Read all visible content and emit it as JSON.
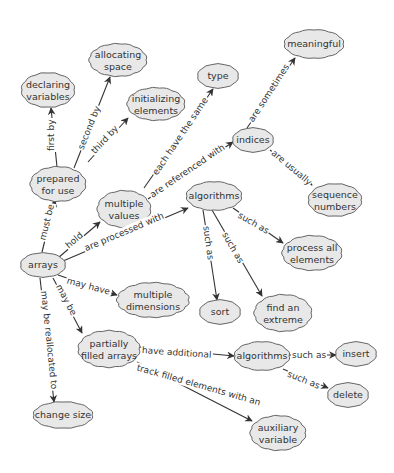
{
  "diagram": {
    "type": "concept-map",
    "style": {
      "cloud_fill": "#e8e8e8",
      "cloud_stroke": "#555555",
      "line_color": "#333333",
      "text_color": "#333333",
      "background": "#ffffff"
    },
    "nodes": [
      {
        "id": "arrays",
        "label": "arrays",
        "x": 43,
        "y": 265,
        "w": 44,
        "h": 24
      },
      {
        "id": "declaring",
        "label": "declaring\nvariables",
        "x": 48,
        "y": 90,
        "w": 52,
        "h": 34
      },
      {
        "id": "allocating",
        "label": "allocating\nspace",
        "x": 118,
        "y": 60,
        "w": 56,
        "h": 32
      },
      {
        "id": "initializing",
        "label": "initializing\nelements",
        "x": 156,
        "y": 104,
        "w": 56,
        "h": 32
      },
      {
        "id": "type",
        "label": "type",
        "x": 218,
        "y": 76,
        "w": 40,
        "h": 24
      },
      {
        "id": "meaningful",
        "label": "meaningful",
        "x": 314,
        "y": 44,
        "w": 58,
        "h": 28
      },
      {
        "id": "prepared",
        "label": "prepared\nfor use",
        "x": 58,
        "y": 184,
        "w": 54,
        "h": 34
      },
      {
        "id": "multiple_values",
        "label": "multiple\nvalues",
        "x": 124,
        "y": 209,
        "w": 52,
        "h": 36
      },
      {
        "id": "indices",
        "label": "indices",
        "x": 253,
        "y": 140,
        "w": 40,
        "h": 24
      },
      {
        "id": "sequence",
        "label": "sequence\nnumbers",
        "x": 335,
        "y": 200,
        "w": 52,
        "h": 32
      },
      {
        "id": "algorithms1",
        "label": "algorithms",
        "x": 214,
        "y": 196,
        "w": 54,
        "h": 28
      },
      {
        "id": "process_all",
        "label": "process all\nelements",
        "x": 312,
        "y": 253,
        "w": 58,
        "h": 34
      },
      {
        "id": "multiple_dims",
        "label": "multiple\ndimensions",
        "x": 153,
        "y": 300,
        "w": 70,
        "h": 34
      },
      {
        "id": "sort",
        "label": "sort",
        "x": 220,
        "y": 312,
        "w": 40,
        "h": 24
      },
      {
        "id": "extreme",
        "label": "find an\nextreme",
        "x": 283,
        "y": 313,
        "w": 56,
        "h": 36
      },
      {
        "id": "partially",
        "label": "partially\nfilled arrays",
        "x": 109,
        "y": 349,
        "w": 60,
        "h": 36
      },
      {
        "id": "algorithms2",
        "label": "algorithms",
        "x": 262,
        "y": 356,
        "w": 54,
        "h": 28
      },
      {
        "id": "insert",
        "label": "insert",
        "x": 356,
        "y": 354,
        "w": 40,
        "h": 24
      },
      {
        "id": "delete",
        "label": "delete",
        "x": 348,
        "y": 395,
        "w": 40,
        "h": 24
      },
      {
        "id": "change_size",
        "label": "change size",
        "x": 63,
        "y": 415,
        "w": 58,
        "h": 26
      },
      {
        "id": "auxiliary",
        "label": "auxiliary\nvariable",
        "x": 278,
        "y": 433,
        "w": 54,
        "h": 34
      }
    ],
    "links": [
      {
        "from": "prepared",
        "to": "declaring",
        "label": "first by",
        "x1": 57,
        "y1": 167,
        "x2": 51,
        "y2": 108,
        "lx": 51,
        "ly": 152,
        "angle": -90
      },
      {
        "from": "prepared",
        "to": "allocating",
        "label": "second by",
        "x1": 74,
        "y1": 168,
        "x2": 110,
        "y2": 77,
        "lx": 80,
        "ly": 150,
        "angle": -68
      },
      {
        "from": "prepared",
        "to": "initializing",
        "label": "third by",
        "x1": 88,
        "y1": 162,
        "x2": 128,
        "y2": 118,
        "lx": 92,
        "ly": 153,
        "angle": -47
      },
      {
        "from": "multiple_values",
        "to": "type",
        "label": "each have the same",
        "x1": 144,
        "y1": 188,
        "x2": 213,
        "y2": 89,
        "lx": 154,
        "ly": 175,
        "angle": -56
      },
      {
        "from": "multiple_values",
        "to": "indices",
        "label": "are referenced with",
        "x1": 148,
        "y1": 199,
        "x2": 233,
        "y2": 142,
        "lx": 150,
        "ly": 196,
        "angle": -34
      },
      {
        "from": "indices",
        "to": "meaningful",
        "label": "are sometimes",
        "x1": 247,
        "y1": 128,
        "x2": 295,
        "y2": 58,
        "lx": 250,
        "ly": 122,
        "angle": -57
      },
      {
        "from": "indices",
        "to": "sequence",
        "label": "are usually",
        "x1": 270,
        "y1": 150,
        "x2": 312,
        "y2": 185,
        "lx": 272,
        "ly": 151,
        "angle": 40
      },
      {
        "from": "arrays",
        "to": "prepared",
        "label": "must be",
        "x1": 42,
        "y1": 252,
        "x2": 55,
        "y2": 200,
        "lx": 42,
        "ly": 241,
        "angle": -76
      },
      {
        "from": "arrays",
        "to": "multiple_values",
        "label": "hold",
        "x1": 58,
        "y1": 258,
        "x2": 100,
        "y2": 222,
        "lx": 66,
        "ly": 247,
        "angle": -40
      },
      {
        "from": "arrays",
        "to": "algorithms1",
        "label": "are processed with",
        "x1": 63,
        "y1": 261,
        "x2": 188,
        "y2": 208,
        "lx": 84,
        "ly": 249,
        "angle": -23
      },
      {
        "from": "arrays",
        "to": "multiple_dims",
        "label": "may have",
        "x1": 58,
        "y1": 275,
        "x2": 117,
        "y2": 295,
        "lx": 66,
        "ly": 280,
        "angle": 15
      },
      {
        "from": "arrays",
        "to": "partially",
        "label": "may be",
        "x1": 53,
        "y1": 278,
        "x2": 82,
        "y2": 333,
        "lx": 58,
        "ly": 284,
        "angle": 62
      },
      {
        "from": "arrays",
        "to": "change_size",
        "label": "may be reallocated to",
        "x1": 40,
        "y1": 278,
        "x2": 54,
        "y2": 402,
        "lx": 44,
        "ly": 290,
        "angle": 84
      },
      {
        "from": "algorithms1",
        "to": "process_all",
        "label": "such as",
        "x1": 233,
        "y1": 208,
        "x2": 283,
        "y2": 243,
        "lx": 238,
        "ly": 214,
        "angle": 30
      },
      {
        "from": "algorithms1",
        "to": "sort",
        "label": "such as",
        "x1": 203,
        "y1": 210,
        "x2": 217,
        "y2": 300,
        "lx": 206,
        "ly": 225,
        "angle": 82
      },
      {
        "from": "algorithms1",
        "to": "extreme",
        "label": "such as",
        "x1": 212,
        "y1": 210,
        "x2": 262,
        "y2": 296,
        "lx": 224,
        "ly": 232,
        "angle": 60
      },
      {
        "from": "partially",
        "to": "algorithms2",
        "label": "have additional",
        "x1": 139,
        "y1": 347,
        "x2": 234,
        "y2": 356,
        "lx": 141,
        "ly": 350,
        "angle": 4
      },
      {
        "from": "partially",
        "to": "auxiliary",
        "label": "track filled elements with an",
        "x1": 137,
        "y1": 362,
        "x2": 252,
        "y2": 421,
        "lx": 136,
        "ly": 367,
        "angle": 16
      },
      {
        "from": "algorithms2",
        "to": "insert",
        "label": "such as",
        "x1": 289,
        "y1": 355,
        "x2": 336,
        "y2": 355,
        "lx": 291,
        "ly": 355,
        "angle": 0
      },
      {
        "from": "algorithms2",
        "to": "delete",
        "label": "such as",
        "x1": 283,
        "y1": 369,
        "x2": 328,
        "y2": 388,
        "lx": 287,
        "ly": 373,
        "angle": 22
      }
    ]
  }
}
